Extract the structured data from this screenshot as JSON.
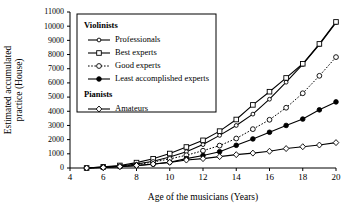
{
  "chart_data": {
    "type": "line",
    "title": "",
    "xlabel": "Age of the musicians (Years)",
    "ylabel": "Estimated accumulated practice (House)",
    "xlim": [
      4,
      20
    ],
    "ylim": [
      0,
      11000
    ],
    "xticks": [
      4,
      6,
      8,
      10,
      12,
      14,
      16,
      18,
      20
    ],
    "yticks": [
      0,
      1000,
      2000,
      3000,
      4000,
      5000,
      6000,
      7000,
      8000,
      9000,
      10000,
      11000
    ],
    "grid": false,
    "legend_position": "upper-left-inside",
    "x": [
      5,
      6,
      7,
      8,
      9,
      10,
      11,
      12,
      13,
      14,
      15,
      16,
      17,
      18,
      19,
      20
    ],
    "series": [
      {
        "name": "Professionals",
        "group": "Violinists",
        "marker": "circle-open-small",
        "linestyle": "solid",
        "values": [
          0,
          60,
          140,
          280,
          480,
          780,
          1150,
          1650,
          2300,
          3000,
          3800,
          4850,
          6050,
          7300,
          8700,
          10250
        ]
      },
      {
        "name": "Best experts",
        "group": "Violinists",
        "marker": "square-open",
        "linestyle": "solid",
        "values": [
          0,
          80,
          180,
          380,
          650,
          1020,
          1480,
          1950,
          2600,
          3420,
          4450,
          5380,
          6350,
          7350,
          8750,
          10300
        ]
      },
      {
        "name": "Good experts",
        "group": "Violinists",
        "marker": "circle-open",
        "linestyle": "dotted",
        "values": [
          0,
          50,
          120,
          230,
          420,
          640,
          900,
          1220,
          1580,
          2080,
          2740,
          3400,
          4250,
          5270,
          6500,
          7820
        ]
      },
      {
        "name": "Least accomplished experts",
        "group": "Violinists",
        "marker": "circle-filled",
        "linestyle": "solid",
        "values": [
          0,
          40,
          90,
          170,
          260,
          400,
          660,
          880,
          1150,
          1600,
          2050,
          2520,
          3000,
          3450,
          4100,
          4660
        ]
      },
      {
        "name": "Amateurs",
        "group": "Pianists",
        "marker": "diamond-open",
        "linestyle": "solid",
        "values": [
          0,
          40,
          100,
          180,
          280,
          400,
          560,
          660,
          800,
          940,
          1050,
          1180,
          1370,
          1500,
          1620,
          1790
        ]
      }
    ],
    "legend": {
      "groups": [
        {
          "heading": "Violinists",
          "entries": [
            {
              "label": "Professionals",
              "marker": "circle-open-small",
              "linestyle": "solid"
            },
            {
              "label": "Best experts",
              "marker": "square-open",
              "linestyle": "solid"
            },
            {
              "label": "Good experts",
              "marker": "circle-open",
              "linestyle": "dotted"
            },
            {
              "label": "Least accomplished experts",
              "marker": "circle-filled",
              "linestyle": "solid"
            }
          ]
        },
        {
          "heading": "Pianists",
          "entries": [
            {
              "label": "Amateurs",
              "marker": "diamond-open",
              "linestyle": "solid"
            }
          ]
        }
      ]
    },
    "colors": {
      "ink": "#000000",
      "background": "#ffffff"
    }
  }
}
